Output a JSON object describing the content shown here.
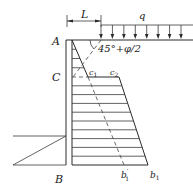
{
  "diagram": {
    "type": "earth-pressure-distribution",
    "labels": {
      "dimension": "L",
      "surcharge": "q",
      "angle": "45°+φ/2",
      "top": "A",
      "middle": "C",
      "bottom": "B",
      "c1": "c",
      "c1_sub": "1",
      "c2": "c",
      "c2_sub": "2",
      "b1prime": "b",
      "b1prime_sub": "1",
      "b1prime_mark": "′",
      "b1": "b",
      "b1_sub": "1"
    },
    "surcharge_arrow_count": 8,
    "hatch_lines_upper": 3,
    "hatch_lines_lower": 10
  }
}
